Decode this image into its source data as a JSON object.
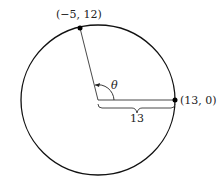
{
  "diagram": {
    "point_top": "(−5, 12)",
    "point_right": "(13, 0)",
    "angle_label": "θ",
    "radius_label": "13"
  }
}
